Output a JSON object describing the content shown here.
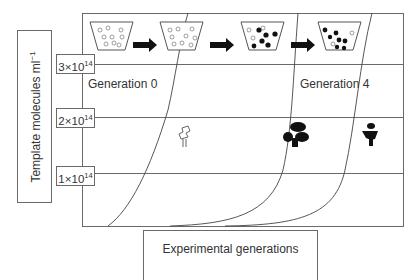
{
  "diagram": {
    "y_axis_label": "Template molecules ml",
    "y_axis_label_sup": "−1",
    "x_axis_label": "Experimental generations",
    "ticks": [
      {
        "coef": "3",
        "times": "×",
        "base": "10",
        "exp": "14"
      },
      {
        "coef": "2",
        "times": "×",
        "base": "10",
        "exp": "14"
      },
      {
        "coef": "1",
        "times": "×",
        "base": "10",
        "exp": "14"
      }
    ],
    "generation_labels": [
      "Generation 0",
      "Generation 4"
    ],
    "beakers": [
      {
        "stage": 1,
        "content": "open template molecules"
      },
      {
        "stage": 2,
        "content": "open template molecules"
      },
      {
        "stage": 3,
        "content": "mostly filled template molecules"
      },
      {
        "stage": 4,
        "content": "mostly filled template molecules"
      }
    ],
    "arrows_between_beakers": 3,
    "molecule_icons": [
      "open-molecule",
      "filled-molecule",
      "filled-small-molecule"
    ],
    "curves": 3,
    "colors": {
      "line": "#555555",
      "frame": "#6a6a6a",
      "molecule_fill": "#111111"
    }
  }
}
